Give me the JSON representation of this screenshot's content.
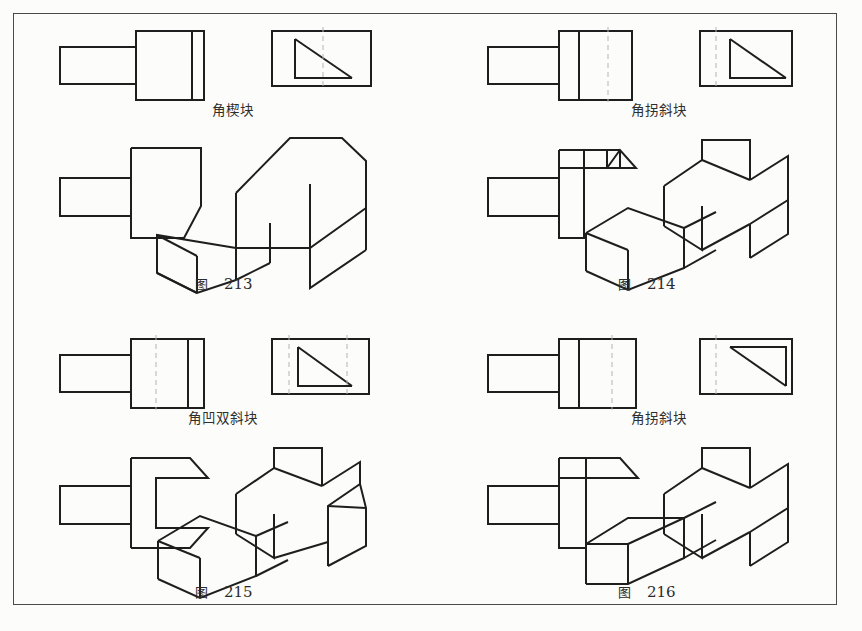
{
  "page": {
    "width": 862,
    "height": 631,
    "background_color": "#fcfcfa",
    "border_color": "#4a4a4a",
    "line_color": "#1e1e1e",
    "dash_color": "#b4b4b4",
    "page_number": ""
  },
  "figures": [
    {
      "id": "fig-213",
      "part_name": "角楔块",
      "caption_word": "图",
      "caption_number": "213",
      "orthographic": {
        "front_view_label": "front-view",
        "side_view_label": "side-view",
        "dashed_centerlines": 1,
        "side_view_shape": "right-triangle-vertical-left-base-bottom"
      },
      "pictorial_label": "isometric-view"
    },
    {
      "id": "fig-214",
      "part_name": "角拐斜块",
      "caption_word": "图",
      "caption_number": "214",
      "orthographic": {
        "front_view_label": "front-view",
        "side_view_label": "side-view",
        "dashed_centerlines": 1,
        "side_view_shape": "right-triangle-vertical-left-base-bottom"
      },
      "pictorial_label": "isometric-view"
    },
    {
      "id": "fig-215",
      "part_name": "角凹双斜块",
      "caption_word": "图",
      "caption_number": "215",
      "orthographic": {
        "front_view_label": "front-view",
        "side_view_label": "side-view",
        "dashed_centerlines": 2,
        "side_view_shape": "right-triangle-vertical-left-base-bottom"
      },
      "pictorial_label": "isometric-view"
    },
    {
      "id": "fig-216",
      "part_name": "角拐斜块",
      "caption_word": "图",
      "caption_number": "216",
      "orthographic": {
        "front_view_label": "front-view",
        "side_view_label": "side-view",
        "dashed_centerlines": 1,
        "side_view_shape": "right-triangle-top-edge-right-vertical"
      },
      "pictorial_label": "isometric-view"
    }
  ]
}
